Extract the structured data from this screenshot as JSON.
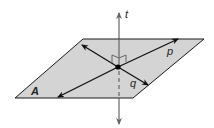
{
  "diagram": {
    "colors": {
      "plane_fill": "#d4d4d4",
      "plane_stroke": "#1a1a1a",
      "line_pq": "#111111",
      "line_t": "#666666",
      "point": "#000000"
    },
    "plane": {
      "label": "A",
      "vertices": [
        [
          83,
          39
        ],
        [
          204,
          39
        ],
        [
          133,
          98
        ],
        [
          15,
          98
        ]
      ]
    },
    "lines": [
      {
        "name": "t",
        "label": "t",
        "type": "vertical line, perpendicular to plane"
      },
      {
        "name": "p",
        "label": "p",
        "type": "line in plane"
      },
      {
        "name": "q",
        "label": "q",
        "type": "line in plane"
      }
    ],
    "intersection_point": [
      118,
      67
    ],
    "right_angle_marks": 2
  }
}
